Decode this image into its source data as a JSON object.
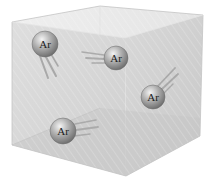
{
  "diagram": {
    "container": {
      "shape": "translucent-box",
      "face_color": "#d6d6d6",
      "top_color": "#ececec",
      "floor_color": "#c9c9c9",
      "edge_color": "#bdbdbd"
    },
    "atoms": [
      {
        "label": "Ar",
        "cx": 45,
        "cy": 44,
        "r": 13,
        "trail_direction": "down-right"
      },
      {
        "label": "Ar",
        "cx": 116,
        "cy": 58,
        "r": 12,
        "trail_direction": "left"
      },
      {
        "label": "Ar",
        "cx": 153,
        "cy": 97,
        "r": 12,
        "trail_direction": "up-right"
      },
      {
        "label": "Ar",
        "cx": 63,
        "cy": 131,
        "r": 13,
        "trail_direction": "right"
      }
    ],
    "atom_color": "#8a8a8a",
    "trail_color": "#9a9a9a"
  }
}
